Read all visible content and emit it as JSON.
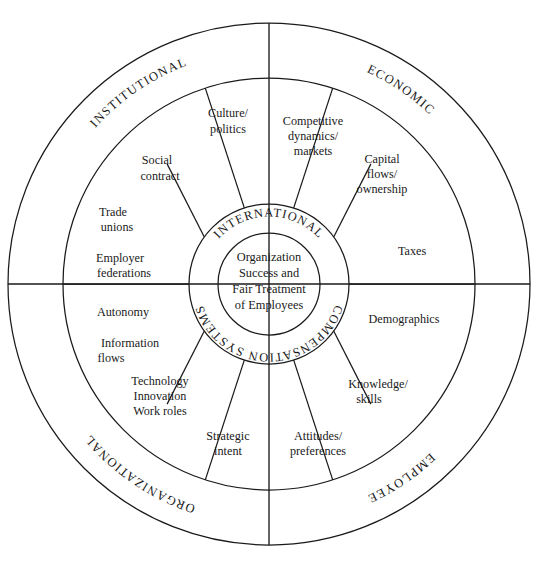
{
  "diagram": {
    "type": "concentric-wheel",
    "title": "",
    "center": {
      "lines": [
        "Organization",
        "Success and",
        "Fair Treatment",
        "of Employees"
      ],
      "text": "Organization Success and Fair Treatment of Employees"
    },
    "inner_ring": {
      "top_label": "INTERNATIONAL",
      "bottom_label": "COMPENSATION SYSTEMS"
    },
    "outer_ring": {
      "quadrants": [
        {
          "label": "INSTITUTIONAL",
          "position": "top-left"
        },
        {
          "label": "ECONOMIC",
          "position": "top-right"
        },
        {
          "label": "ORGANIZATIONAL",
          "position": "bottom-left"
        },
        {
          "label": "EMPLOYEE",
          "position": "bottom-right"
        }
      ]
    },
    "middle_ring": {
      "segment_count": 10,
      "segments": [
        {
          "id": "competitive-dynamics-markets",
          "lines": [
            "Competitive",
            "dynamics/",
            "markets"
          ],
          "quadrant": "ECONOMIC"
        },
        {
          "id": "capital-flows-ownership",
          "lines": [
            "Capital",
            "flows/",
            "ownership"
          ],
          "quadrant": "ECONOMIC"
        },
        {
          "id": "taxes",
          "lines": [
            "Taxes"
          ],
          "quadrant": "ECONOMIC"
        },
        {
          "id": "demographics",
          "lines": [
            "Demographics"
          ],
          "quadrant": "EMPLOYEE"
        },
        {
          "id": "knowledge-skills",
          "lines": [
            "Knowledge/",
            "skills"
          ],
          "quadrant": "EMPLOYEE"
        },
        {
          "id": "attitudes-preferences",
          "lines": [
            "Attitudes/",
            "preferences"
          ],
          "quadrant": "EMPLOYEE"
        },
        {
          "id": "strategic-intent",
          "lines": [
            "Strategic",
            "intent"
          ],
          "quadrant": "ORGANIZATIONAL"
        },
        {
          "id": "technology-innovation-work-roles",
          "lines": [
            "Technology",
            "Innovation",
            "Work roles"
          ],
          "quadrant": "ORGANIZATIONAL"
        },
        {
          "id": "autonomy-information-flows",
          "lines": [
            "Autonomy",
            "",
            "Information",
            "flows"
          ],
          "quadrant": "ORGANIZATIONAL"
        },
        {
          "id": "trade-unions-employer-federations",
          "lines": [
            "Trade",
            "unions",
            "",
            "Employer",
            "federations"
          ],
          "quadrant": "INSTITUTIONAL"
        },
        {
          "id": "social-contract",
          "lines": [
            "Social",
            "contract"
          ],
          "quadrant": "INSTITUTIONAL"
        },
        {
          "id": "culture-politics",
          "lines": [
            "Culture/",
            "politics"
          ],
          "quadrant": "INSTITUTIONAL"
        }
      ]
    },
    "colors": {
      "line": "#1a1a1a",
      "background": "#ffffff",
      "text": "#1a1a1a"
    }
  }
}
